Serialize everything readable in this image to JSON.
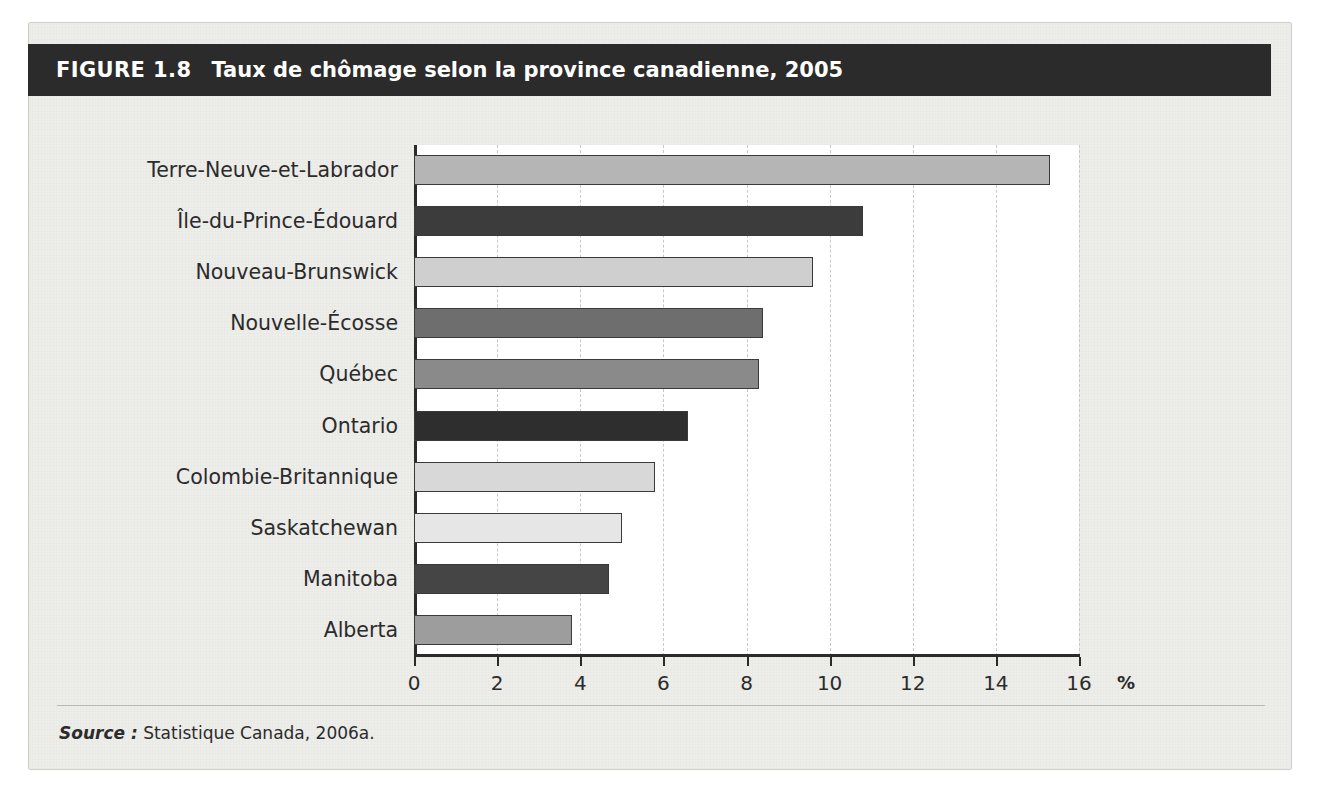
{
  "figure": {
    "label": "FIGURE 1.8",
    "title": "Taux de chômage selon la province canadienne, 2005",
    "source_keyword": "Source :",
    "source_text": " Statistique Canada, 2006a."
  },
  "axis": {
    "unit_symbol": "%",
    "ticks": [
      "0",
      "2",
      "4",
      "6",
      "8",
      "10",
      "12",
      "14",
      "16"
    ]
  },
  "chart_data": {
    "type": "bar",
    "orientation": "horizontal",
    "title": "Taux de chômage selon la province canadienne, 2005",
    "xlabel": "%",
    "ylabel": "",
    "xlim": [
      0,
      16
    ],
    "xticks": [
      0,
      2,
      4,
      6,
      8,
      10,
      12,
      14,
      16
    ],
    "grid": "vertical-dashed",
    "legend": "none",
    "categories": [
      "Terre-Neuve-et-Labrador",
      "Île-du-Prince-Édouard",
      "Nouveau-Brunswick",
      "Nouvelle-Écosse",
      "Québec",
      "Ontario",
      "Colombie-Britannique",
      "Saskatchewan",
      "Manitoba",
      "Alberta"
    ],
    "values": [
      15.3,
      10.8,
      9.6,
      8.4,
      8.3,
      6.6,
      5.8,
      5.0,
      4.7,
      3.8
    ],
    "bar_colors": [
      "#b5b5b5",
      "#3c3c3c",
      "#cfcfcf",
      "#6e6e6e",
      "#8a8a8a",
      "#2e2e2e",
      "#d8d8d8",
      "#e6e6e6",
      "#454545",
      "#9d9d9d"
    ]
  }
}
